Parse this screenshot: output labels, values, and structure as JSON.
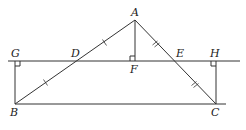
{
  "diagram": {
    "type": "geometry",
    "points": {
      "A": {
        "label": "A",
        "x": 135,
        "y": 20
      },
      "B": {
        "label": "B",
        "x": 15,
        "y": 104
      },
      "C": {
        "label": "C",
        "x": 216,
        "y": 104
      },
      "D": {
        "label": "D",
        "x": 76,
        "y": 61
      },
      "E": {
        "label": "E",
        "x": 174,
        "y": 61
      },
      "F": {
        "label": "F",
        "x": 135,
        "y": 61
      },
      "G": {
        "label": "G",
        "x": 15,
        "y": 61
      },
      "H": {
        "label": "H",
        "x": 216,
        "y": 61
      }
    },
    "segments": [
      "AB",
      "AC",
      "BC",
      "AF",
      "BG",
      "CH",
      "GH"
    ],
    "equal_marks": {
      "single_tick": [
        "AD",
        "DB"
      ],
      "double_tick": [
        "AE",
        "EC"
      ]
    },
    "right_angles": [
      "G",
      "F",
      "H"
    ],
    "caption": ""
  }
}
